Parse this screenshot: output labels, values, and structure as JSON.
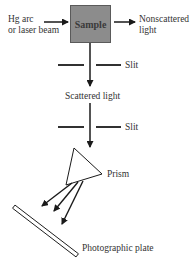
{
  "diagram": {
    "source_label": {
      "line1": "Hg arc",
      "line2": "or laser beam"
    },
    "sample_label": "Sample",
    "nonscattered_label": {
      "line1": "Nonscattered",
      "line2": "light"
    },
    "slit1_label": "Slit",
    "scattered_label": "Scattered light",
    "slit2_label": "Slit",
    "prism_label": "Prism",
    "plate_label": "Photographic plate",
    "colors": {
      "sample_fill": "#8c8c8c",
      "sample_border": "#5a5a5a",
      "line": "#1a1a1a"
    }
  }
}
